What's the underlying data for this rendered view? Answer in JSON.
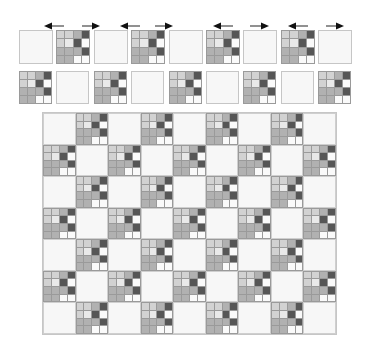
{
  "colors": {
    "background": "#ffffff",
    "blank_fill": "#f7f7f7",
    "border": "#c6c6c6",
    "arrow": "#111111",
    "light": "#d2d2d2",
    "very_light": "#e9e9e9",
    "mid": "#b1b1b1",
    "dark": "#565656",
    "white": "#fafafa"
  },
  "tile_pattern": [
    [
      "light",
      "light",
      "mid",
      "dark"
    ],
    [
      "light",
      "very_light",
      "dark",
      "white"
    ],
    [
      "mid",
      "mid",
      "mid",
      "dark"
    ],
    [
      "mid",
      "mid",
      "white",
      "white"
    ]
  ],
  "arrows": [
    {
      "direction": "left",
      "x": 44,
      "width": 20
    },
    {
      "direction": "right",
      "x": 82,
      "width": 18
    },
    {
      "direction": "left",
      "x": 120,
      "width": 20
    },
    {
      "direction": "right",
      "x": 155,
      "width": 18
    },
    {
      "direction": "left",
      "x": 213,
      "width": 20
    },
    {
      "direction": "right",
      "x": 250,
      "width": 19
    },
    {
      "direction": "left",
      "x": 288,
      "width": 20
    },
    {
      "direction": "right",
      "x": 326,
      "width": 18
    }
  ],
  "top_strip": {
    "y": 30,
    "tile_size": 34,
    "start_x": 19,
    "step": 37.4,
    "tiles": [
      "blank",
      "pattern",
      "blank",
      "pattern",
      "blank",
      "pattern",
      "blank",
      "pattern",
      "blank"
    ]
  },
  "second_strip": {
    "y": 71,
    "tile_size": 33,
    "start_x": 19,
    "step": 37.4,
    "tiles": [
      "pattern",
      "blank",
      "pattern",
      "blank",
      "pattern",
      "blank",
      "pattern",
      "blank",
      "pattern"
    ]
  },
  "big_grid": {
    "columns": 9,
    "rows": 7,
    "first_cell": "blank",
    "layout": "checkerboard"
  }
}
